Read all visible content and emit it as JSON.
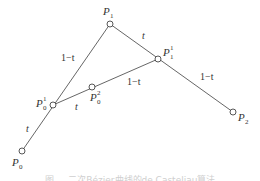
{
  "diagram": {
    "points": [
      {
        "id": "P0",
        "base": "P",
        "sub": "0",
        "sup": ""
      },
      {
        "id": "P1",
        "base": "P",
        "sub": "1",
        "sup": ""
      },
      {
        "id": "P2",
        "base": "P",
        "sub": "2",
        "sup": ""
      },
      {
        "id": "P0_1",
        "base": "P",
        "sub": "0",
        "sup": "1"
      },
      {
        "id": "P1_1",
        "base": "P",
        "sub": "1",
        "sup": "1"
      },
      {
        "id": "P0_2",
        "base": "P",
        "sub": "0",
        "sup": "2"
      }
    ],
    "edges": [
      {
        "from": "P0",
        "to": "P1"
      },
      {
        "from": "P1",
        "to": "P2"
      },
      {
        "from": "P0_1",
        "to": "P1_1"
      }
    ],
    "weights": [
      {
        "segment": "P0-P0_1",
        "text": "t"
      },
      {
        "segment": "P0_1-P1",
        "text": "1−t"
      },
      {
        "segment": "P1-P1_1",
        "text": "t"
      },
      {
        "segment": "P1_1-P2",
        "text": "1−t"
      },
      {
        "segment": "P0_1-P0_2",
        "text": "t"
      },
      {
        "segment": "P0_2-P1_1",
        "text": "1−t"
      }
    ],
    "caption": "图 … 二次Bézier曲线的de Casteljau算法"
  }
}
